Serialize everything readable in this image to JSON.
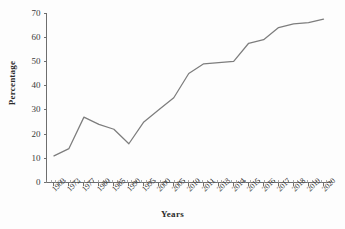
{
  "chart_data": {
    "type": "line",
    "title": "",
    "xlabel": "Years",
    "ylabel": "Percentage",
    "categories": [
      "1969",
      "1972",
      "1977",
      "1980",
      "1985",
      "1990",
      "1995",
      "2000",
      "2005",
      "2010",
      "2011",
      "2013",
      "2014",
      "2015",
      "2016",
      "2017",
      "2018",
      "2019",
      "2020"
    ],
    "values": [
      11,
      14,
      27,
      24,
      22,
      16,
      25,
      30,
      35,
      45,
      49,
      49.5,
      50,
      57.5,
      59,
      64,
      65.5,
      66,
      67.5
    ],
    "series": [
      {
        "name": "Percentage",
        "values": [
          11,
          14,
          27,
          24,
          22,
          16,
          25,
          30,
          35,
          45,
          49,
          49.5,
          50,
          57.5,
          59,
          64,
          65.5,
          66,
          67.5
        ],
        "color": "#7d7d7d"
      }
    ],
    "ylim": [
      0,
      70
    ],
    "ytick_labels": [
      "0",
      "10",
      "20",
      "30",
      "40",
      "50",
      "60",
      "70"
    ],
    "ytick_values": [
      0,
      10,
      20,
      30,
      40,
      50,
      60,
      70
    ],
    "grid": false,
    "legend": false,
    "legend_position": "none",
    "line_color": "#7d7d7d",
    "axis_color": "#6e6e6e",
    "background_color": "#fdfdfd",
    "xtick_rotation": -45,
    "minor_ticks_x": true
  }
}
